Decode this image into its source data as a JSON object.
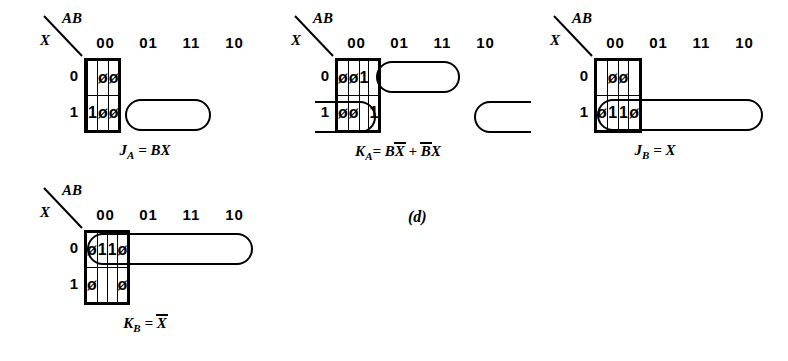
{
  "figure": {
    "panel_label": "(d)",
    "background": "#ffffff",
    "ink": "#000000"
  },
  "axis": {
    "col_var_label": "AB",
    "row_var_label": "X",
    "col_headers": [
      "00",
      "01",
      "11",
      "10"
    ],
    "row_headers": [
      "0",
      "1"
    ]
  },
  "kmaps": [
    {
      "id": "ja",
      "caption_main": "J",
      "caption_sub": "A",
      "caption_eq": " = BX",
      "caption_plain": "J_A = BX",
      "rows": [
        [
          "",
          "",
          "ø",
          "ø"
        ],
        [
          "",
          "1",
          "ø",
          "ø"
        ]
      ],
      "groups": [
        {
          "name": "bx-group",
          "row": 1,
          "col_start": 1,
          "col_span": 2,
          "wrap": "none"
        }
      ]
    },
    {
      "id": "ka",
      "caption_main": "K",
      "caption_sub": "A",
      "caption_eq_parts": [
        "= B",
        "X",
        " + ",
        "B",
        "X"
      ],
      "caption_plain": "K_A = B X-bar + B-bar X",
      "rows": [
        [
          "ø",
          "ø",
          "1",
          ""
        ],
        [
          "ø",
          "ø",
          "",
          "1"
        ]
      ],
      "groups": [
        {
          "name": "bxbar-group",
          "row": 0,
          "col_start": 1,
          "col_span": 2,
          "wrap": "none"
        },
        {
          "name": "bbarx-group-left",
          "row": 1,
          "col_start": 0,
          "col_span": 1,
          "wrap": "left"
        },
        {
          "name": "bbarx-group-right",
          "row": 1,
          "col_start": 3,
          "col_span": 1,
          "wrap": "right"
        }
      ]
    },
    {
      "id": "jb",
      "caption_main": "J",
      "caption_sub": "B",
      "caption_eq": " = X",
      "caption_plain": "J_B = X",
      "rows": [
        [
          "",
          "ø",
          "ø",
          ""
        ],
        [
          "ø",
          "1",
          "1",
          "ø"
        ]
      ],
      "groups": [
        {
          "name": "x-group",
          "row": 1,
          "col_start": 0,
          "col_span": 4,
          "wrap": "none"
        }
      ]
    },
    {
      "id": "kb",
      "caption_main": "K",
      "caption_sub": "B",
      "caption_eq_over": "X",
      "caption_eq_pre": " = ",
      "caption_plain": "K_B = X-bar",
      "rows": [
        [
          "ø",
          "1",
          "1",
          "ø"
        ],
        [
          "ø",
          "",
          "",
          "ø"
        ]
      ],
      "groups": [
        {
          "name": "xbar-group",
          "row": 0,
          "col_start": 0,
          "col_span": 4,
          "wrap": "none"
        }
      ]
    }
  ]
}
